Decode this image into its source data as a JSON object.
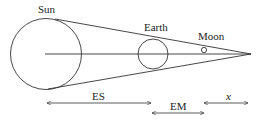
{
  "diagram": {
    "type": "eclipse-geometry",
    "labels": {
      "sun": "Sun",
      "earth": "Earth",
      "moon": "Moon"
    },
    "distances": {
      "earth_sun": "ES",
      "earth_moon": "EM",
      "moon_apex": "x"
    },
    "colors": {
      "stroke": "#333333",
      "background": "#ffffff"
    }
  }
}
